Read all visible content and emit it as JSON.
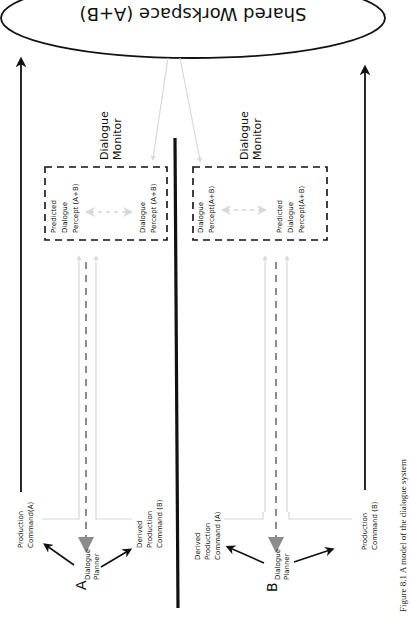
{
  "diagram": {
    "shared_workspace": {
      "label": "Shared Workspace (A+B)"
    },
    "agent_a": {
      "id_label": "A",
      "planner_line1": "Dialogue",
      "planner_line2": "Planner",
      "monitor_line1": "Dialogue",
      "monitor_line2": "Monitor",
      "predicted_line1": "Predicted",
      "predicted_line2": "Dialogue",
      "predicted_line3": "Percept (A+B)",
      "percept_line1": "Dialogue",
      "percept_line2": "Percept (A+B)",
      "production_line1": "Production",
      "production_line2": "Command(A)",
      "derived_line1": "Derived",
      "derived_line2": "Production",
      "derived_line3": "Command (B)"
    },
    "agent_b": {
      "id_label": "B",
      "planner_line1": "Dialogue",
      "planner_line2": "Planner",
      "monitor_line1": "Dialogue",
      "monitor_line2": "Monitor",
      "percept_line1": "Dialogue",
      "percept_line2": "Percept(A+B)",
      "predicted_line1": "Predicted",
      "predicted_line2": "Dialogue",
      "predicted_line3": "Percept(A+B)",
      "derived_line1": "Derived",
      "derived_line2": "Production",
      "derived_line3": "Command (A)",
      "production_line1": "Production",
      "production_line2": "Command (B)"
    },
    "caption": "Figure 8.1  A model of the dialogue system",
    "colors": {
      "black": "#111111",
      "gray_arrow": "#8c8c8c",
      "light_gray": "#d4d4d4"
    }
  }
}
